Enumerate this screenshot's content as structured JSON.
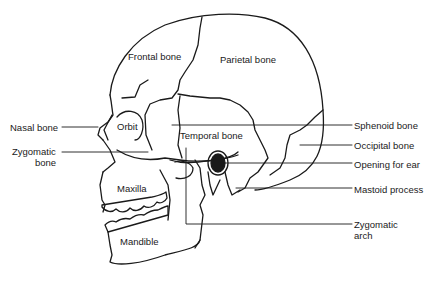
{
  "diagram": {
    "type": "anatomical-illustration",
    "labels": {
      "frontal": "Frontal bone",
      "parietal": "Parietal bone",
      "nasal": "Nasal bone",
      "orbit": "Orbit",
      "zygomatic_bone_1": "Zygomatic",
      "zygomatic_bone_2": "bone",
      "temporal": "Temporal bone",
      "maxilla": "Maxilla",
      "mandible": "Mandible",
      "sphenoid": "Sphenoid bone",
      "occipital": "Occipital bone",
      "ear": "Opening for ear",
      "mastoid": "Mastoid process",
      "zygomatic_arch_1": "Zygomatic",
      "zygomatic_arch_2": "arch"
    },
    "colors": {
      "line": "#1a1a1a",
      "background": "#ffffff"
    }
  }
}
